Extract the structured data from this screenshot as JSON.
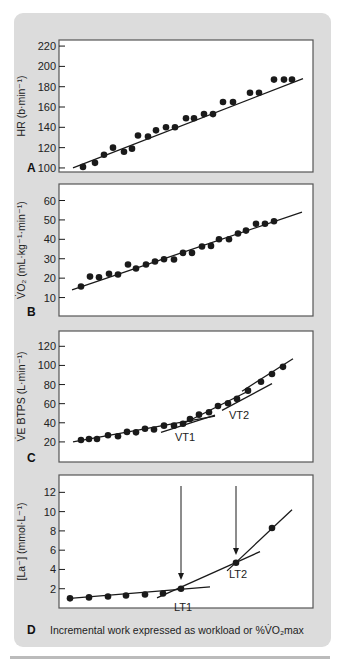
{
  "colors": {
    "background_box": "#dcdcdc",
    "plot_bg": "#ffffff",
    "frame": "#555555",
    "ink": "#1a1a1a"
  },
  "x_axis_caption": {
    "letter": "D",
    "text": "Incremental work expressed as workload or %V̇O₂max"
  },
  "chart_data": [
    {
      "id": "A",
      "type": "scatter",
      "panel_letter": "A",
      "ylabel": "HR (b·min⁻¹)",
      "xlabel": "Incremental work expressed as workload or %V̇O₂max",
      "yticks": [
        100,
        120,
        140,
        160,
        180,
        200,
        220
      ],
      "ylim": [
        96,
        226
      ],
      "frame": {
        "x": 59,
        "y": 40,
        "w": 254,
        "h": 132
      },
      "x_px": [
        83,
        95,
        104,
        113,
        124,
        132,
        138,
        148,
        156,
        166,
        175,
        186,
        194,
        204,
        213,
        223,
        233,
        250,
        259,
        274,
        284,
        292
      ],
      "values": [
        101,
        105,
        113,
        120,
        116,
        119,
        132,
        131,
        137,
        140,
        140,
        149,
        149,
        153,
        153,
        165,
        165,
        174,
        174,
        187,
        187,
        187
      ],
      "fit_lines": [
        {
          "x1": 73,
          "y1": 100,
          "x2": 303,
          "y2": 188
        }
      ],
      "annotations": [],
      "arrows": []
    },
    {
      "id": "B",
      "type": "scatter",
      "panel_letter": "B",
      "ylabel": "V̇O₂ (mL·kg⁻¹·min⁻¹)",
      "xlabel": "Incremental work expressed as workload or %V̇O₂max",
      "yticks": [
        10,
        20,
        30,
        40,
        50,
        60
      ],
      "ylim": [
        0.5,
        68.5
      ],
      "frame": {
        "x": 59,
        "y": 184,
        "w": 254,
        "h": 132
      },
      "x_px": [
        81,
        90,
        99,
        109,
        118,
        128,
        136,
        146,
        155,
        164,
        174,
        183,
        192,
        202,
        211,
        219,
        229,
        238,
        246,
        256,
        265,
        274
      ],
      "values": [
        15.7,
        20.8,
        20.4,
        22.3,
        21.9,
        27,
        25,
        27,
        28.6,
        29.7,
        29.6,
        33,
        33,
        36.3,
        36.6,
        40,
        40,
        43,
        44.5,
        48,
        48,
        49.3
      ],
      "fit_lines": [
        {
          "x1": 72,
          "y1": 14,
          "x2": 302,
          "y2": 54
        }
      ],
      "annotations": [],
      "arrows": []
    },
    {
      "id": "C",
      "type": "scatter",
      "panel_letter": "C",
      "ylabel": "V̇E BTPS (L·min⁻¹)",
      "xlabel": "Incremental work expressed as workload or %V̇O₂max",
      "yticks": [
        20,
        40,
        60,
        80,
        100,
        120
      ],
      "ylim": [
        -1,
        136
      ],
      "frame": {
        "x": 59,
        "y": 331,
        "w": 254,
        "h": 131
      },
      "x_px": [
        81,
        89,
        97,
        108,
        118,
        127,
        136,
        145,
        154,
        164,
        174,
        183,
        190,
        199,
        209,
        218,
        228,
        237,
        248,
        261,
        272,
        283
      ],
      "values": [
        22,
        23,
        23,
        27,
        26,
        30.5,
        30,
        33.7,
        33,
        37,
        37,
        39,
        44,
        48.5,
        51,
        57.5,
        60.5,
        65,
        73.6,
        83,
        91,
        98.5
      ],
      "fit_lines": [
        {
          "x1": 73,
          "y1": 20,
          "x2": 215,
          "y2": 47
        },
        {
          "x1": 161,
          "y1": 30,
          "x2": 215,
          "y2": 48
        },
        {
          "x1": 222,
          "y1": 53,
          "x2": 272,
          "y2": 81
        },
        {
          "x1": 242,
          "y1": 73,
          "x2": 293,
          "y2": 107
        },
        {
          "x1": 183,
          "y1": 39,
          "x2": 250,
          "y2": 74
        }
      ],
      "annotations": [
        {
          "text": "VT1",
          "x": 175,
          "y": 441
        },
        {
          "text": "VT2",
          "x": 229,
          "y": 419
        }
      ],
      "arrows": []
    },
    {
      "id": "D",
      "type": "scatter",
      "panel_letter": "D",
      "ylabel": "[La⁻] (mmol·L⁻¹)",
      "xlabel": "Incremental work expressed as workload or %V̇O₂max",
      "yticks": [
        2,
        4,
        6,
        8,
        10,
        12
      ],
      "ylim": [
        0,
        13.8
      ],
      "frame": {
        "x": 59,
        "y": 475,
        "w": 254,
        "h": 133
      },
      "x_px": [
        70,
        89,
        108,
        126,
        145,
        163,
        181,
        236,
        272
      ],
      "values": [
        1.0,
        1.1,
        1.2,
        1.3,
        1.4,
        1.5,
        2.0,
        4.7,
        8.3
      ],
      "fit_lines": [
        {
          "x1": 70,
          "y1": 1.0,
          "x2": 210,
          "y2": 2.2
        },
        {
          "x1": 157,
          "y1": 1.05,
          "x2": 260,
          "y2": 5.85
        },
        {
          "x1": 227,
          "y1": 3.85,
          "x2": 292,
          "y2": 10.2
        }
      ],
      "annotations": [
        {
          "text": "LT1",
          "x": 174,
          "y": 611
        },
        {
          "text": "LT2",
          "x": 229,
          "y": 578
        }
      ],
      "arrows": [
        {
          "label": "LT1",
          "x": 181,
          "y_from": 486,
          "y_to": 580
        },
        {
          "label": "LT2",
          "x": 236,
          "y_from": 486,
          "y_to": 555
        }
      ]
    }
  ]
}
